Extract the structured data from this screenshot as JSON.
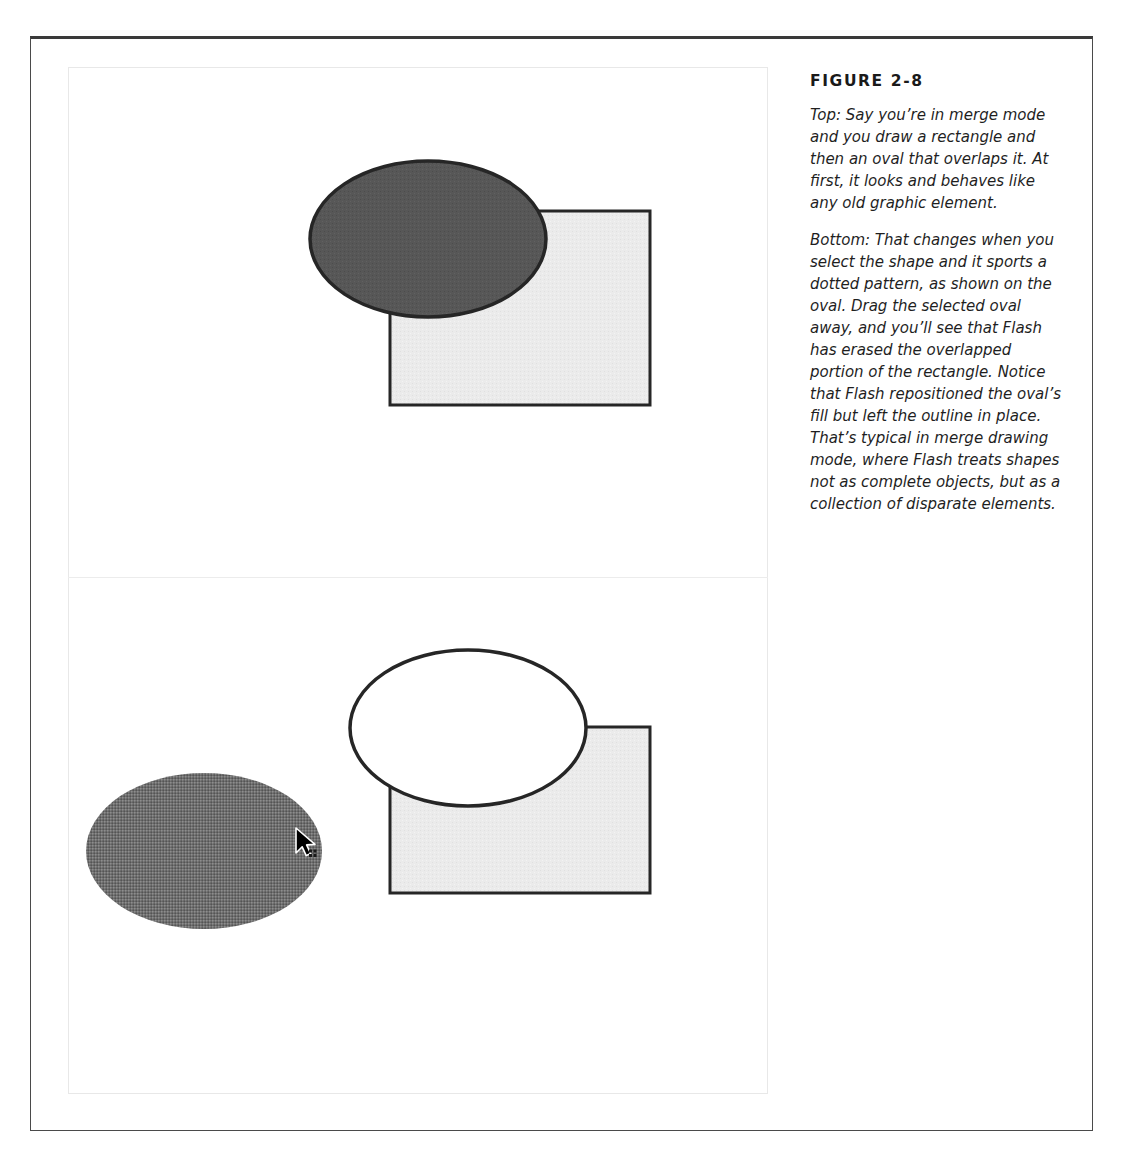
{
  "figure": {
    "label": "FIGURE 2-8",
    "caption_paragraphs": [
      "Top: Say you’re in merge mode and you draw a rectangle and then an oval that overlaps it. At first, it looks and behaves like any old graphic element.",
      "Bottom: That changes when you select the shape and it sports a dotted pattern, as shown on the oval. Drag the selected oval away, and you’ll see that Flash has erased the overlapped portion of the rectangle. Notice that Flash repositioned the oval’s fill but left the outline in place. That’s typical in merge drawing mode, where Flash treats shapes not as complete objects, but as a collection of disparate elements."
    ]
  },
  "colors": {
    "page_border": "#4a4a4a",
    "frame_border": "#e8e8e8",
    "divider": "#ececec",
    "oval_dark_fill": "#575757",
    "oval_selected_fill": "#6e6e6e",
    "rectangle_fill": "#eaeaea",
    "shape_outline": "#262626",
    "oval_empty_fill": "#ffffff",
    "caption_text": "#1f1f1f",
    "title_text": "#1a1a1a"
  },
  "panels": {
    "top": {
      "name": "merge-mode-before-drag",
      "shapes": [
        {
          "name": "rectangle",
          "type": "rect",
          "x": 322,
          "y": 144,
          "width": 260,
          "height": 194,
          "fill": "#eaeaea",
          "stroke": "#262626",
          "stroke_width": 3
        },
        {
          "name": "oval",
          "type": "ellipse",
          "cx": 360,
          "cy": 172,
          "rx": 118,
          "ry": 78,
          "fill": "#575757",
          "stroke": "#262626",
          "stroke_width": 3,
          "state": "unselected"
        }
      ]
    },
    "bottom": {
      "name": "merge-mode-after-drag",
      "shapes": [
        {
          "name": "rectangle-erased",
          "type": "rect",
          "x": 322,
          "y": 149,
          "width": 260,
          "height": 166,
          "fill": "#eaeaea",
          "stroke": "#262626",
          "stroke_width": 3,
          "note": "overlapped portion erased by oval"
        },
        {
          "name": "oval-outline-left-behind",
          "type": "ellipse",
          "cx": 400,
          "cy": 150,
          "rx": 118,
          "ry": 78,
          "fill": "#ffffff",
          "stroke": "#262626",
          "stroke_width": 3,
          "state": "fill-removed"
        },
        {
          "name": "oval-selected-dragged",
          "type": "ellipse",
          "cx": 136,
          "cy": 273,
          "rx": 118,
          "ry": 78,
          "fill": "#6e6e6e",
          "stroke": "none",
          "state": "selected-dotted-pattern"
        }
      ],
      "cursor": {
        "name": "arrow-move-cursor",
        "x": 230,
        "y": 253,
        "type": "arrow-with-move-badge"
      }
    }
  }
}
